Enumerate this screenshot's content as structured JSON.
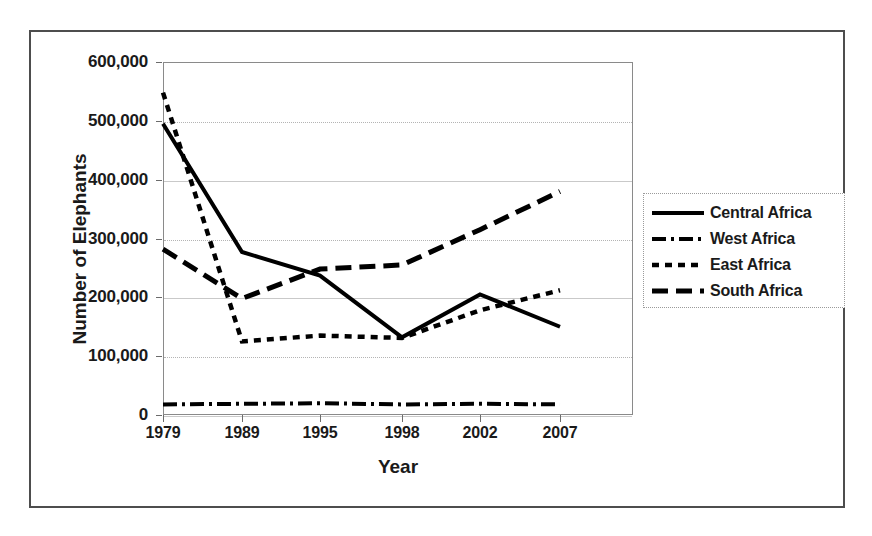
{
  "chart_data": {
    "type": "line",
    "title": "",
    "xlabel": "Year",
    "ylabel": "Number of Elephants",
    "categories": [
      "1979",
      "1989",
      "1995",
      "1998",
      "2002",
      "2007"
    ],
    "x": [
      1979,
      1989,
      1995,
      1998,
      2002,
      2007
    ],
    "ylim": [
      0,
      600000
    ],
    "ytick_labels": [
      "600,000",
      "500,000",
      "400,000",
      "300,000",
      "200,000",
      "100,000",
      "0"
    ],
    "ytick_values": [
      600000,
      500000,
      400000,
      300000,
      200000,
      100000,
      0
    ],
    "grid": true,
    "legend_position": "right",
    "series": [
      {
        "name": "Central Africa",
        "style": "solid",
        "color": "#000000",
        "values": [
          495000,
          277000,
          237000,
          132000,
          205000,
          150000
        ]
      },
      {
        "name": "West Africa",
        "style": "dash-dot",
        "color": "#000000",
        "values": [
          18000,
          19000,
          20000,
          18000,
          19000,
          18000
        ]
      },
      {
        "name": "East Africa",
        "style": "short-dash",
        "color": "#000000",
        "values": [
          548000,
          125000,
          135000,
          131000,
          178000,
          212000
        ]
      },
      {
        "name": "South Africa",
        "style": "long-dash",
        "color": "#000000",
        "values": [
          282000,
          198000,
          248000,
          255000,
          315000,
          380000
        ]
      }
    ]
  },
  "axes": {
    "x_title": "Year",
    "y_title": "Number of Elephants"
  },
  "legend": {
    "items": [
      {
        "label": "Central Africa",
        "style": "solid"
      },
      {
        "label": "West Africa",
        "style": "dash-dot"
      },
      {
        "label": "East Africa",
        "style": "short-dash"
      },
      {
        "label": "South Africa",
        "style": "long-dash"
      }
    ]
  }
}
